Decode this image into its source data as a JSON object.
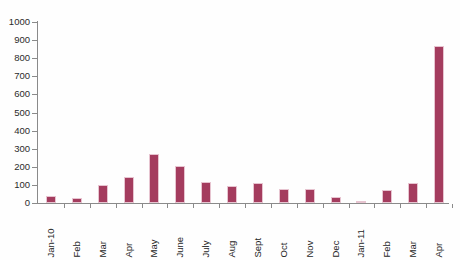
{
  "chart_data": {
    "type": "bar",
    "title": "",
    "xlabel": "",
    "ylabel": "",
    "ylim": [
      0,
      1000
    ],
    "ytick_step": 100,
    "grid": false,
    "legend": "none",
    "bar_color": "#a43c5e",
    "axis_color": "#8a8a8a",
    "categories": [
      "Jan-10",
      "Feb",
      "Mar",
      "Apr",
      "May",
      "June",
      "July",
      "Aug",
      "Sept",
      "Oct",
      "Nov",
      "Dec",
      "Jan-11",
      "Feb",
      "Mar",
      "Apr"
    ],
    "values": [
      40,
      28,
      100,
      145,
      270,
      205,
      115,
      95,
      110,
      75,
      80,
      35,
      10,
      70,
      110,
      870
    ],
    "yticks": [
      "0",
      "100",
      "200",
      "300",
      "400",
      "500",
      "600",
      "700",
      "800",
      "900",
      "1000"
    ]
  }
}
